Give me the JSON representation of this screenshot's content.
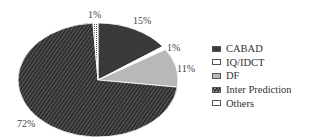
{
  "chart_data": {
    "type": "pie",
    "title": "",
    "start_angle": "12 o'clock, clockwise",
    "categories": [
      "CABAD",
      "IQ/IDCT",
      "DF",
      "Inter Prediction",
      "Others"
    ],
    "values": [
      15,
      1,
      11,
      72,
      1
    ],
    "labels": [
      "15%",
      "1%",
      "11%",
      "72%",
      "1%"
    ],
    "colors": [
      "#3a3a3a",
      "#ffffff",
      "#b8b8b8",
      "#3a3a3a",
      "#ffffff"
    ],
    "fills": [
      "solid",
      "solid",
      "solid",
      "diagonal-hatch",
      "dotted"
    ],
    "legend_position": "right"
  },
  "legend": [
    {
      "label": "CABAD"
    },
    {
      "label": "IQ/IDCT"
    },
    {
      "label": "DF"
    },
    {
      "label": "Inter Prediction"
    },
    {
      "label": "Others"
    }
  ]
}
